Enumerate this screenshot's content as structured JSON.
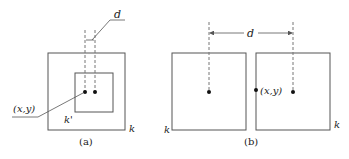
{
  "colors": {
    "stroke": "#555555",
    "dashed": "#777777",
    "dot": "#111111",
    "text": "#222222"
  },
  "panel_a": {
    "caption": "(a)",
    "outer_label": "k",
    "inner_label": "k'",
    "point_label": "(x,y)",
    "distance_label": "d"
  },
  "panel_b": {
    "caption": "(b)",
    "left_label": "k",
    "right_label": "k",
    "point_label": "(x,y)",
    "distance_label": "d"
  }
}
